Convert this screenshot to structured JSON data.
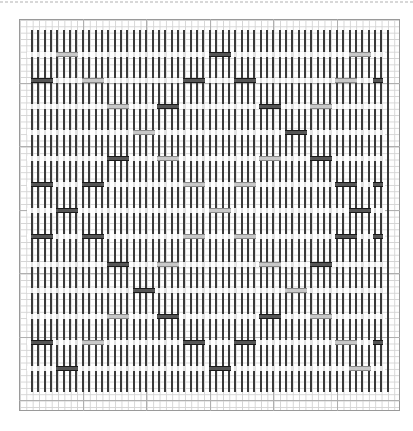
{
  "chart_data": {
    "type": "weaving-draft",
    "title": "",
    "grid": {
      "left": 19,
      "top": 19,
      "width": 381,
      "height": 392,
      "cell_px": 6.35,
      "major_every_cells": 10
    },
    "warp": {
      "count": 57,
      "x_start": 31,
      "x_step": 6.35,
      "y_start": 30,
      "y_end": 392,
      "color": "#3a3a3a"
    },
    "weft_rows_y": [
      54,
      80,
      106,
      132,
      158,
      184,
      210,
      236,
      264,
      290,
      316,
      342,
      368
    ],
    "colors": {
      "dark": "#1a1a1a",
      "grey": "#8a8a8a",
      "grid": "#d4d4d4",
      "border": "#9a9a9a"
    },
    "markers": [
      {
        "y": 54,
        "spans": [
          [
            56,
            78,
            "grey"
          ],
          [
            209,
            231,
            "dark"
          ],
          [
            349,
            371,
            "grey"
          ]
        ]
      },
      {
        "y": 80,
        "spans": [
          [
            31,
            53,
            "dark"
          ],
          [
            82,
            104,
            "grey"
          ],
          [
            183,
            205,
            "dark"
          ],
          [
            234,
            256,
            "dark"
          ],
          [
            335,
            357,
            "grey"
          ],
          [
            373,
            383,
            "dark"
          ]
        ]
      },
      {
        "y": 106,
        "spans": [
          [
            107,
            129,
            "grey"
          ],
          [
            157,
            179,
            "dark"
          ],
          [
            259,
            281,
            "dark"
          ],
          [
            310,
            332,
            "grey"
          ]
        ]
      },
      {
        "y": 132,
        "spans": [
          [
            133,
            155,
            "grey"
          ],
          [
            285,
            307,
            "dark"
          ]
        ]
      },
      {
        "y": 158,
        "spans": [
          [
            107,
            129,
            "dark"
          ],
          [
            157,
            179,
            "grey"
          ],
          [
            259,
            281,
            "grey"
          ],
          [
            310,
            332,
            "dark"
          ]
        ]
      },
      {
        "y": 184,
        "spans": [
          [
            31,
            53,
            "dark"
          ],
          [
            82,
            104,
            "dark"
          ],
          [
            183,
            205,
            "grey"
          ],
          [
            234,
            256,
            "grey"
          ],
          [
            335,
            357,
            "dark"
          ],
          [
            373,
            383,
            "dark"
          ]
        ]
      },
      {
        "y": 210,
        "spans": [
          [
            56,
            78,
            "dark"
          ],
          [
            209,
            231,
            "grey"
          ],
          [
            349,
            371,
            "dark"
          ]
        ]
      },
      {
        "y": 236,
        "spans": [
          [
            31,
            53,
            "dark"
          ],
          [
            82,
            104,
            "dark"
          ],
          [
            183,
            205,
            "grey"
          ],
          [
            234,
            256,
            "grey"
          ],
          [
            335,
            357,
            "dark"
          ],
          [
            373,
            383,
            "dark"
          ]
        ]
      },
      {
        "y": 264,
        "spans": [
          [
            107,
            129,
            "dark"
          ],
          [
            157,
            179,
            "grey"
          ],
          [
            259,
            281,
            "grey"
          ],
          [
            310,
            332,
            "dark"
          ]
        ]
      },
      {
        "y": 290,
        "spans": [
          [
            133,
            155,
            "dark"
          ],
          [
            285,
            307,
            "grey"
          ]
        ]
      },
      {
        "y": 316,
        "spans": [
          [
            107,
            129,
            "grey"
          ],
          [
            157,
            179,
            "dark"
          ],
          [
            259,
            281,
            "dark"
          ],
          [
            310,
            332,
            "grey"
          ]
        ]
      },
      {
        "y": 342,
        "spans": [
          [
            31,
            53,
            "dark"
          ],
          [
            82,
            104,
            "grey"
          ],
          [
            183,
            205,
            "dark"
          ],
          [
            234,
            256,
            "dark"
          ],
          [
            335,
            357,
            "grey"
          ],
          [
            373,
            383,
            "dark"
          ]
        ]
      },
      {
        "y": 368,
        "spans": [
          [
            56,
            78,
            "dark"
          ],
          [
            209,
            231,
            "dark"
          ],
          [
            349,
            371,
            "grey"
          ]
        ]
      }
    ]
  }
}
